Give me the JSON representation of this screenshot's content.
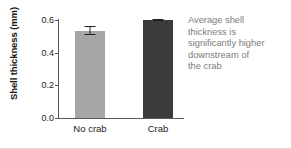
{
  "chart_data": {
    "type": "bar",
    "title": "",
    "subtitle": "",
    "xlabel": "",
    "ylabel": "Shell thickness (mm)",
    "categories": [
      "No crab",
      "Crab"
    ],
    "values": [
      0.53,
      0.595
    ],
    "errors": [
      0.027,
      0.008
    ],
    "error_low": [
      0.503,
      0.587
    ],
    "error_high": [
      0.557,
      0.603
    ],
    "ylim": [
      0.0,
      0.6
    ],
    "yticks": [
      0.0,
      0.2,
      0.4,
      0.6
    ],
    "ytick_labels": [
      "0.0",
      "0.2",
      "0.4",
      "0.6"
    ],
    "grid": false,
    "legend": "none",
    "bar_colors": [
      "#a6a6a6",
      "#3b3b3b"
    ],
    "axis_color": "#5a5a5a",
    "errorbar_color": "#1f1f1f",
    "annotation_color": "#7b7b7b",
    "annotation": "Average shell thickness is significantly higher downstream of the crab",
    "annotation_lines": [
      "Average shell",
      "thickness is",
      "significantly higher",
      "downstream of",
      "the crab"
    ]
  }
}
